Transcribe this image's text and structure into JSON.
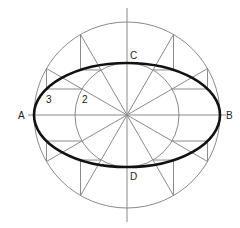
{
  "diagram": {
    "center": [
      127,
      115
    ],
    "outer_radius": 93,
    "inner_radius": 52,
    "radial_angles_deg": [
      0,
      30,
      60,
      90,
      120,
      150,
      180,
      210,
      240,
      270,
      300,
      330
    ],
    "colors": {
      "construction": "#8a8a8a",
      "ellipse": "#111111",
      "text": "#222222"
    },
    "labels": {
      "A": "A",
      "B": "B",
      "C": "C",
      "D": "D",
      "p3": "3",
      "p2": "2"
    }
  }
}
